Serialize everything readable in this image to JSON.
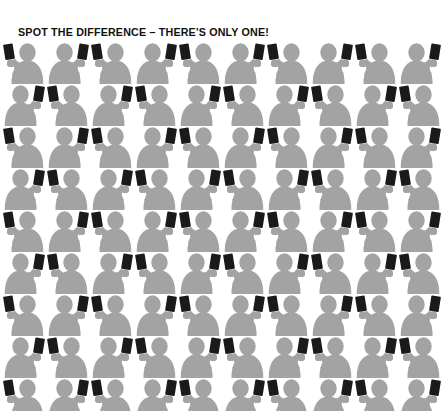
{
  "poster": {
    "width": 442,
    "height": 411,
    "background_color": "#ffffff",
    "title": "SPOT THE DIFFERENCE – THERE'S ONLY ONE!",
    "title_color": "#111111"
  },
  "illustration": {
    "subject": "crowd-of-people-holding-smartphones",
    "figure_color": "#a3a3a3",
    "phone_color": "#1a1a1a",
    "columns": 10,
    "rows": 9,
    "cell_width": 44,
    "cell_height": 42,
    "figure_icon": "person-holding-phone-icon",
    "bottom_row_clipped": true,
    "rows_data": [
      {
        "label": "row-1",
        "flips": [
          false,
          true,
          false,
          true,
          false,
          true,
          false,
          true,
          false,
          true
        ]
      },
      {
        "label": "row-2",
        "flips": [
          true,
          false,
          true,
          false,
          true,
          false,
          true,
          false,
          true,
          false
        ]
      },
      {
        "label": "row-3",
        "flips": [
          false,
          true,
          false,
          true,
          false,
          true,
          false,
          true,
          false,
          true
        ]
      },
      {
        "label": "row-4",
        "flips": [
          true,
          false,
          true,
          false,
          true,
          false,
          true,
          false,
          true,
          false
        ]
      },
      {
        "label": "row-5",
        "flips": [
          false,
          true,
          false,
          true,
          false,
          true,
          false,
          true,
          false,
          true
        ]
      },
      {
        "label": "row-6",
        "flips": [
          true,
          false,
          true,
          false,
          true,
          false,
          true,
          false,
          true,
          false
        ]
      },
      {
        "label": "row-7",
        "flips": [
          false,
          true,
          false,
          true,
          false,
          true,
          false,
          true,
          false,
          true
        ]
      },
      {
        "label": "row-8",
        "flips": [
          true,
          false,
          true,
          false,
          true,
          false,
          true,
          false,
          true,
          false
        ]
      },
      {
        "label": "row-9",
        "flips": [
          false,
          true,
          false,
          true,
          false,
          true,
          false,
          true,
          false,
          true
        ]
      }
    ]
  }
}
